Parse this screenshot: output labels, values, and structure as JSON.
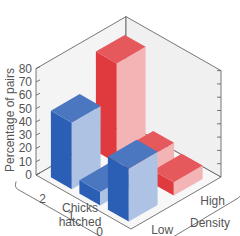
{
  "chart_data": {
    "type": "bar",
    "subtype": "3d-grouped-bar",
    "title": "",
    "ylabel": "Percentage of pairs",
    "xlabel": "Chicks hatched",
    "zlabel": "Density",
    "ylim": [
      0,
      80
    ],
    "yticks": [
      "0",
      "10",
      "20",
      "30",
      "40",
      "50",
      "60",
      "70",
      "80"
    ],
    "categories": [
      "2",
      "1",
      "0"
    ],
    "density_labels": [
      "Low",
      "High"
    ],
    "series": [
      {
        "name": "Low",
        "color": "#2b5eb5",
        "values": [
          50,
          10,
          40
        ]
      },
      {
        "name": "High",
        "color": "#e03a3e",
        "values": [
          75,
          15,
          10
        ]
      }
    ],
    "grid": false
  }
}
